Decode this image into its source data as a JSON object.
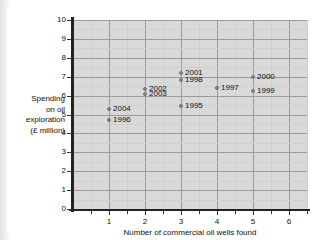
{
  "chart_data": {
    "type": "scatter",
    "title": "",
    "xlabel": "Number of commercial oil wells found",
    "ylabel": "Spending on oil exploration (£ million)",
    "ylabel_lines": [
      "Spending",
      "on oil",
      "exploration",
      "(£ million)"
    ],
    "xlim": [
      0,
      6.5
    ],
    "ylim": [
      0,
      10
    ],
    "x_ticks": [
      1,
      2,
      3,
      4,
      5,
      6
    ],
    "x_tick_labels": [
      "1",
      "2",
      "3",
      "4",
      "5",
      "6"
    ],
    "x_minor_step": 0.5,
    "y_ticks": [
      0,
      1,
      2,
      3,
      4,
      5,
      6,
      7,
      8,
      9,
      10
    ],
    "y_tick_labels": [
      "0",
      "1",
      "2",
      "3",
      "4",
      "5",
      "6",
      "7",
      "8",
      "9",
      "10"
    ],
    "y_minor_step": 0.5,
    "grid": true,
    "legend": false,
    "plot_background": "#d9d9d9",
    "marker_color": "#8e8e8e",
    "axis_color": "#222222",
    "points": [
      {
        "label": "2004",
        "x": 1,
        "y": 5.3
      },
      {
        "label": "1996",
        "x": 1,
        "y": 4.7
      },
      {
        "label": "2002",
        "x": 2,
        "y": 6.35
      },
      {
        "label": "2003",
        "x": 2,
        "y": 6.1
      },
      {
        "label": "2001",
        "x": 3,
        "y": 7.2
      },
      {
        "label": "1998",
        "x": 3,
        "y": 6.8
      },
      {
        "label": "1995",
        "x": 3,
        "y": 5.45
      },
      {
        "label": "1997",
        "x": 4,
        "y": 6.4
      },
      {
        "label": "2000",
        "x": 5,
        "y": 7.0
      },
      {
        "label": "1999",
        "x": 5,
        "y": 6.25
      }
    ]
  }
}
